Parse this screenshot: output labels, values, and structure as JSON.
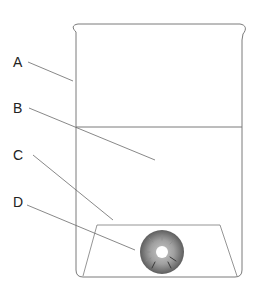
{
  "diagram": {
    "type": "labeled-apparatus",
    "labels": [
      {
        "id": "A",
        "text": "A",
        "x": 13,
        "y": 55,
        "target": "beaker-wall"
      },
      {
        "id": "B",
        "text": "B",
        "x": 13,
        "y": 101,
        "target": "liquid"
      },
      {
        "id": "C",
        "text": "C",
        "x": 13,
        "y": 148,
        "target": "glass-base-support"
      },
      {
        "id": "D",
        "text": "D",
        "x": 13,
        "y": 195,
        "target": "disc"
      }
    ],
    "colors": {
      "outline": "#7a7a7a",
      "leader": "#6a6a6a",
      "disc_dark": "#555555",
      "disc_light": "#a8a8a8",
      "text": "#222222"
    }
  }
}
